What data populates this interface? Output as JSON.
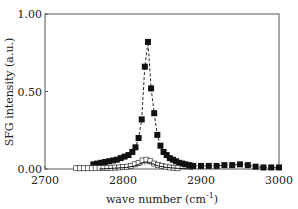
{
  "chart_data": {
    "type": "line",
    "title": "",
    "xlabel": "wave number (cm",
    "xlabel_sup": "-1",
    "xlabel_tail": ")",
    "ylabel": "SFG intensity (a.u.)",
    "xlim": [
      2700,
      3000
    ],
    "ylim": [
      0,
      1.0
    ],
    "grid": false,
    "legend": null,
    "x_ticks": [
      2700,
      2800,
      2900,
      3000
    ],
    "x_tick_labels": [
      "2700",
      "2800",
      "2900",
      "3000"
    ],
    "y_ticks": [
      0,
      0.5,
      1.0
    ],
    "y_tick_labels": [
      "0.00",
      "0.50",
      "1.00"
    ],
    "series": [
      {
        "name": "filled squares (measured, dashed fit)",
        "marker": "filled-square",
        "line": "dashed",
        "x": [
          2762,
          2767,
          2772,
          2777,
          2782,
          2787,
          2792,
          2797,
          2802,
          2807,
          2812,
          2816,
          2820,
          2824,
          2828,
          2832,
          2836,
          2840,
          2844,
          2848,
          2852,
          2856,
          2860,
          2864,
          2868,
          2872,
          2876,
          2880,
          2885,
          2890,
          2900,
          2910,
          2920,
          2930,
          2940,
          2950,
          2960,
          2970,
          2980,
          2990,
          3000
        ],
        "y": [
          0.03,
          0.035,
          0.04,
          0.045,
          0.05,
          0.055,
          0.06,
          0.07,
          0.08,
          0.09,
          0.11,
          0.14,
          0.2,
          0.32,
          0.66,
          0.82,
          0.52,
          0.36,
          0.22,
          0.15,
          0.11,
          0.09,
          0.07,
          0.06,
          0.05,
          0.04,
          0.035,
          0.03,
          0.025,
          0.02,
          0.02,
          0.02,
          0.02,
          0.025,
          0.025,
          0.03,
          0.025,
          0.015,
          0.01,
          0.01,
          0.01
        ]
      },
      {
        "name": "open squares",
        "marker": "open-square",
        "line": "none",
        "x": [
          2740,
          2745,
          2750,
          2755,
          2760,
          2765,
          2770,
          2775,
          2780,
          2785,
          2790,
          2795,
          2800,
          2805,
          2810,
          2815,
          2820,
          2825,
          2830,
          2835,
          2840,
          2845,
          2850,
          2855,
          2860,
          2865,
          2870
        ],
        "y": [
          0.005,
          0.005,
          0.005,
          0.005,
          0.005,
          0.006,
          0.006,
          0.006,
          0.007,
          0.008,
          0.009,
          0.01,
          0.012,
          0.015,
          0.02,
          0.03,
          0.04,
          0.055,
          0.06,
          0.05,
          0.035,
          0.025,
          0.02,
          0.015,
          0.01,
          0.008,
          0.005
        ]
      },
      {
        "name": "component curve (solid)",
        "marker": "none",
        "line": "solid",
        "x": [
          2770,
          2790,
          2805,
          2815,
          2822,
          2828,
          2832,
          2838,
          2845,
          2855,
          2870,
          2890
        ],
        "y": [
          0.0,
          0.005,
          0.01,
          0.02,
          0.035,
          0.045,
          0.045,
          0.035,
          0.02,
          0.01,
          0.004,
          0.0
        ]
      },
      {
        "name": "component curve (dotted)",
        "marker": "none",
        "line": "dotted",
        "x": [
          2770,
          2800,
          2815,
          2825,
          2832,
          2840,
          2850,
          2865,
          2890
        ],
        "y": [
          0.0,
          0.008,
          0.018,
          0.03,
          0.035,
          0.028,
          0.015,
          0.006,
          0.0
        ]
      }
    ]
  }
}
